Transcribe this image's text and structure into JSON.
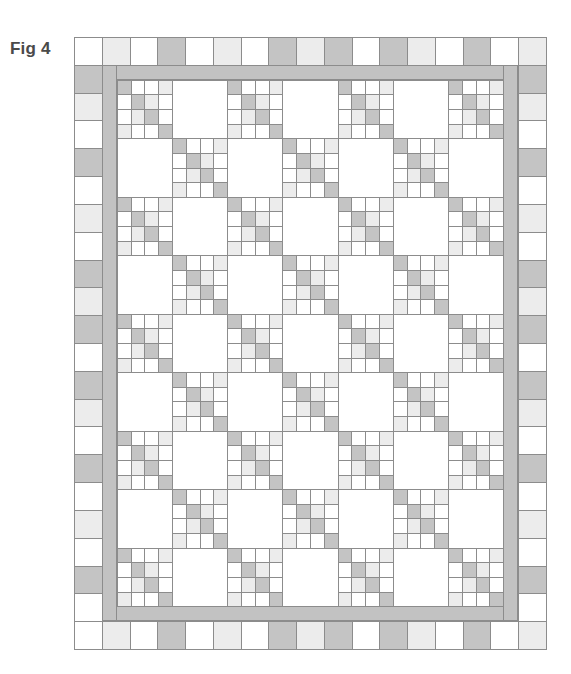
{
  "figure": {
    "label": "Fig 4"
  },
  "colors": {
    "W": "#ffffff",
    "L": "#ececec",
    "D": "#c4c4c4",
    "strip": "#c2c2c2",
    "line": "#8c8c8c"
  },
  "quilt": {
    "border_cell_size": 27.8,
    "columns": 17,
    "rows": 22,
    "top_border": [
      "W",
      "L",
      "W",
      "D",
      "W",
      "L",
      "W",
      "D",
      "L",
      "D",
      "W",
      "D",
      "L",
      "W",
      "D",
      "W",
      "L"
    ],
    "bottom_border": [
      "W",
      "L",
      "W",
      "D",
      "W",
      "L",
      "W",
      "D",
      "L",
      "D",
      "W",
      "D",
      "L",
      "W",
      "D",
      "W",
      "L"
    ],
    "left_border": [
      "D",
      "L",
      "W",
      "D",
      "W",
      "L",
      "W",
      "D",
      "L",
      "D",
      "W",
      "D",
      "L",
      "W",
      "D",
      "W",
      "L",
      "W",
      "D",
      "W"
    ],
    "right_border": [
      "D",
      "L",
      "W",
      "D",
      "W",
      "L",
      "W",
      "D",
      "L",
      "D",
      "W",
      "D",
      "L",
      "W",
      "D",
      "W",
      "L",
      "W",
      "D",
      "W"
    ],
    "center": {
      "block_columns": 7,
      "block_rows": 9,
      "block_size": 56,
      "pieced_block_rule": "row+col even",
      "pieced_block_pattern": [
        [
          "D",
          "W",
          "W",
          "L"
        ],
        [
          "W",
          "D",
          "L",
          "W"
        ],
        [
          "W",
          "L",
          "D",
          "W"
        ],
        [
          "L",
          "W",
          "W",
          "D"
        ]
      ],
      "plain_block_color": "W"
    }
  }
}
